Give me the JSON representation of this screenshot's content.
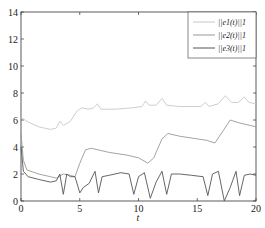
{
  "chart_data": {
    "type": "line",
    "title": "",
    "xlabel": "t",
    "ylabel": "",
    "xlim": [
      0,
      20
    ],
    "ylim": [
      0,
      14
    ],
    "xticks": [
      0,
      5,
      10,
      15,
      20
    ],
    "yticks": [
      0,
      2,
      4,
      6,
      8,
      10,
      12,
      14
    ],
    "grid": false,
    "legend_position": "upper right",
    "series": [
      {
        "name": "||e1(t)||1",
        "color": "#c8c8c8",
        "points": [
          [
            0,
            6.2
          ],
          [
            0.5,
            5.9
          ],
          [
            1.5,
            5.5
          ],
          [
            2.5,
            5.3
          ],
          [
            3.0,
            5.4
          ],
          [
            3.3,
            5.9
          ],
          [
            3.6,
            5.6
          ],
          [
            4.2,
            5.9
          ],
          [
            4.8,
            6.7
          ],
          [
            5.2,
            6.9
          ],
          [
            5.7,
            6.8
          ],
          [
            6.2,
            6.9
          ],
          [
            6.5,
            7.2
          ],
          [
            6.8,
            6.8
          ],
          [
            8,
            6.8
          ],
          [
            9.5,
            6.9
          ],
          [
            10.3,
            7.0
          ],
          [
            10.6,
            7.4
          ],
          [
            10.9,
            7.1
          ],
          [
            11.5,
            7.1
          ],
          [
            12.0,
            7.6
          ],
          [
            12.4,
            7.1
          ],
          [
            13.5,
            7.0
          ],
          [
            15.3,
            7.0
          ],
          [
            15.7,
            7.3
          ],
          [
            16.0,
            7.0
          ],
          [
            16.8,
            7.2
          ],
          [
            17.4,
            7.8
          ],
          [
            17.9,
            7.3
          ],
          [
            18.5,
            7.3
          ],
          [
            19.0,
            7.7
          ],
          [
            19.4,
            7.3
          ],
          [
            20,
            7.2
          ]
        ]
      },
      {
        "name": "||e2(t)||1",
        "color": "#999999",
        "points": [
          [
            0,
            5.0
          ],
          [
            0.2,
            3.0
          ],
          [
            0.5,
            2.3
          ],
          [
            1.5,
            2.0
          ],
          [
            2.5,
            1.8
          ],
          [
            3.0,
            1.7
          ],
          [
            3.6,
            2.0
          ],
          [
            4.2,
            1.9
          ],
          [
            4.6,
            1.8
          ],
          [
            5.0,
            2.8
          ],
          [
            5.5,
            3.8
          ],
          [
            6.0,
            3.9
          ],
          [
            7.5,
            3.6
          ],
          [
            9.0,
            3.4
          ],
          [
            10.0,
            3.2
          ],
          [
            10.8,
            2.8
          ],
          [
            11.3,
            3.2
          ],
          [
            12.0,
            4.6
          ],
          [
            12.5,
            5.0
          ],
          [
            13.5,
            4.8
          ],
          [
            15.0,
            4.6
          ],
          [
            15.8,
            4.5
          ],
          [
            16.5,
            4.3
          ],
          [
            17.2,
            5.2
          ],
          [
            17.8,
            6.0
          ],
          [
            18.5,
            5.8
          ],
          [
            19.5,
            5.6
          ],
          [
            20,
            5.5
          ]
        ]
      },
      {
        "name": "||e3(t)||1",
        "color": "#555555",
        "points": [
          [
            0,
            4.0
          ],
          [
            0.2,
            2.2
          ],
          [
            0.6,
            1.8
          ],
          [
            1.5,
            1.6
          ],
          [
            2.5,
            1.4
          ],
          [
            3.0,
            1.5
          ],
          [
            3.3,
            2.0
          ],
          [
            3.6,
            0.5
          ],
          [
            3.9,
            2.0
          ],
          [
            4.2,
            1.8
          ],
          [
            4.6,
            1.8
          ],
          [
            5.0,
            0.6
          ],
          [
            5.3,
            1.0
          ],
          [
            5.8,
            1.3
          ],
          [
            6.3,
            2.2
          ],
          [
            6.6,
            0.6
          ],
          [
            6.9,
            1.8
          ],
          [
            7.5,
            1.9
          ],
          [
            8.5,
            2.1
          ],
          [
            9.2,
            2.0
          ],
          [
            9.6,
            0.5
          ],
          [
            10.0,
            1.8
          ],
          [
            10.5,
            2.1
          ],
          [
            11.0,
            0.2
          ],
          [
            11.5,
            1.4
          ],
          [
            12.0,
            2.2
          ],
          [
            12.4,
            0.5
          ],
          [
            12.8,
            2.0
          ],
          [
            13.5,
            2.0
          ],
          [
            14.5,
            1.9
          ],
          [
            15.5,
            1.8
          ],
          [
            15.9,
            0.4
          ],
          [
            16.3,
            2.0
          ],
          [
            16.8,
            2.2
          ],
          [
            17.3,
            0.0
          ],
          [
            17.8,
            1.0
          ],
          [
            18.3,
            2.2
          ],
          [
            18.6,
            0.4
          ],
          [
            19.0,
            1.9
          ],
          [
            19.5,
            2.0
          ],
          [
            20,
            1.9
          ]
        ]
      }
    ]
  },
  "legend": {
    "items": [
      {
        "label": "||e1(t)||1"
      },
      {
        "label": "||e2(t)||1"
      },
      {
        "label": "||e3(t)||1"
      }
    ]
  }
}
